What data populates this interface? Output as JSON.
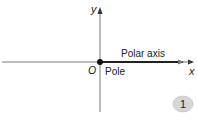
{
  "diagram": {
    "y_axis_label": "y",
    "x_axis_label": "x",
    "origin_label": "O",
    "pole_label": "Pole",
    "polar_axis_label": "Polar axis",
    "badge_number": "1"
  },
  "colors": {
    "axis": "#555555",
    "polar_axis": "#222222",
    "badge_fill": "#d6d6d6",
    "badge_text": "#111111"
  }
}
